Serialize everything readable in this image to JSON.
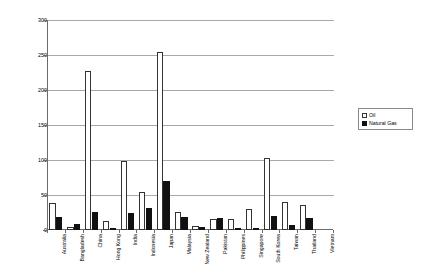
{
  "chart_data": {
    "type": "bar",
    "title": "",
    "xlabel": "",
    "ylabel": "Million Tonnes (or Equivalent)",
    "ylim": [
      0,
      300
    ],
    "ytick_values": [
      300,
      250,
      200,
      150,
      100,
      50,
      0
    ],
    "ytick_labels": [
      "300",
      "250",
      "200",
      "150",
      "100",
      "50",
      "0"
    ],
    "grid": true,
    "legend_position": "right",
    "categories": [
      "Australia",
      "Bangladesh",
      "China",
      "Hong Kong",
      "India",
      "Indonesia",
      "Japan",
      "Malaysia",
      "New Zealand",
      "Pakistan",
      "Philippines",
      "Singapore",
      "South Korea",
      "Taiwan",
      "Thailand",
      "Vietnam"
    ],
    "series": [
      {
        "name": "Oil",
        "color": "#ffffff",
        "values": [
          39,
          4,
          227,
          13,
          98,
          55,
          255,
          26,
          6,
          16,
          16,
          30,
          103,
          40,
          36,
          0
        ]
      },
      {
        "name": "Natural Gas",
        "color": "#111111",
        "values": [
          19,
          9,
          26,
          2,
          24,
          32,
          70,
          19,
          5,
          17,
          3,
          1,
          20,
          7,
          17,
          0
        ]
      }
    ]
  },
  "legend": {
    "items": [
      {
        "label": "Oil",
        "swatch": "white-square"
      },
      {
        "label": "Natural Gas",
        "swatch": "black-square"
      }
    ]
  }
}
